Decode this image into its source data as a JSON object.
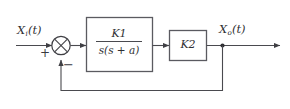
{
  "diagram": {
    "type": "control-system-block-diagram",
    "background_color": "#ffffff",
    "line_color": "#4a4a4f",
    "text_color": "#2f2f33",
    "signals": {
      "input": {
        "symbol": "X",
        "subscript": "i",
        "argument": "(t)",
        "full_label": "X_i(t)"
      },
      "output": {
        "symbol": "X",
        "subscript": "o",
        "argument": "(t)",
        "full_label": "X_o(t)"
      }
    },
    "summing_junction": {
      "style": "circle-with-cross",
      "input_sign": "+",
      "feedback_sign": "−"
    },
    "blocks": [
      {
        "name": "forward-plant-block",
        "transfer_function": "K_1 / s(s + a)",
        "numerator": {
          "symbol": "K",
          "subscript": "1"
        },
        "denominator": "s(s + a)"
      },
      {
        "name": "gain-block",
        "transfer_function": "K_2",
        "symbol": "K",
        "subscript": "2"
      }
    ],
    "feedback": {
      "path": "unity",
      "description": "output tapped after gain block, routed back to summing junction"
    }
  }
}
